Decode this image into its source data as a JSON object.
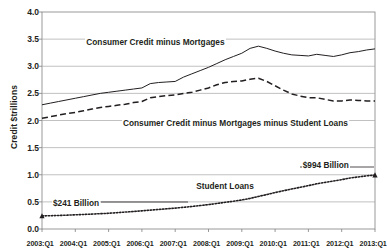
{
  "chart_data": {
    "type": "line",
    "title": "",
    "xlabel": "",
    "ylabel": "Credit $trillions",
    "ylim": [
      0.0,
      4.0
    ],
    "yticks": [
      "0.0",
      "0.5",
      "1.0",
      "1.5",
      "2.0",
      "2.5",
      "3.0",
      "3.5",
      "4.0"
    ],
    "ytick_values": [
      0.0,
      0.5,
      1.0,
      1.5,
      2.0,
      2.5,
      3.0,
      3.5,
      4.0
    ],
    "grid": "horizontal",
    "legend": "inline-annotations",
    "categories": [
      "2003:Q1",
      "2003:Q2",
      "2003:Q3",
      "2003:Q4",
      "2004:Q1",
      "2004:Q2",
      "2004:Q3",
      "2004:Q4",
      "2005:Q1",
      "2005:Q2",
      "2005:Q3",
      "2005:Q4",
      "2006:Q1",
      "2006:Q2",
      "2006:Q3",
      "2006:Q4",
      "2007:Q1",
      "2007:Q2",
      "2007:Q3",
      "2007:Q4",
      "2008:Q1",
      "2008:Q2",
      "2008:Q3",
      "2008:Q4",
      "2009:Q1",
      "2009:Q2",
      "2009:Q3",
      "2009:Q4",
      "2010:Q1",
      "2010:Q2",
      "2010:Q3",
      "2010:Q4",
      "2011:Q1",
      "2011:Q2",
      "2011:Q3",
      "2011:Q4",
      "2012:Q1",
      "2012:Q2",
      "2012:Q3",
      "2012:Q4",
      "2013:Q1"
    ],
    "xticks": [
      "2003:Q1",
      "2004:Q1",
      "2005:Q1",
      "2006:Q1",
      "2007:Q1",
      "2008:Q1",
      "2009:Q1",
      "2010:Q1",
      "2011:Q1",
      "2012:Q1",
      "2013:Q1"
    ],
    "series": [
      {
        "name": "Consumer Credit minus Mortgages",
        "style": "solid",
        "label_text": "Consumer Credit minus Mortgages",
        "values": [
          2.29,
          2.32,
          2.35,
          2.38,
          2.41,
          2.44,
          2.47,
          2.5,
          2.52,
          2.54,
          2.56,
          2.58,
          2.6,
          2.68,
          2.7,
          2.71,
          2.72,
          2.8,
          2.86,
          2.92,
          2.98,
          3.05,
          3.12,
          3.18,
          3.24,
          3.33,
          3.37,
          3.33,
          3.28,
          3.24,
          3.21,
          3.2,
          3.19,
          3.22,
          3.2,
          3.18,
          3.21,
          3.25,
          3.27,
          3.3,
          3.32
        ]
      },
      {
        "name": "Consumer Credit minus Mortgages minus Student Loans",
        "style": "dashed",
        "label_text": "Consumer Credit minus Mortgages minus Student Loans",
        "values": [
          2.04,
          2.07,
          2.1,
          2.13,
          2.15,
          2.18,
          2.21,
          2.24,
          2.26,
          2.28,
          2.3,
          2.33,
          2.35,
          2.42,
          2.44,
          2.46,
          2.47,
          2.5,
          2.52,
          2.56,
          2.6,
          2.66,
          2.7,
          2.72,
          2.73,
          2.76,
          2.78,
          2.72,
          2.64,
          2.56,
          2.49,
          2.45,
          2.42,
          2.42,
          2.39,
          2.36,
          2.36,
          2.38,
          2.37,
          2.36,
          2.36
        ]
      },
      {
        "name": "Student Loans",
        "style": "dotted",
        "label_text": "Student Loans",
        "values": [
          0.241,
          0.245,
          0.25,
          0.255,
          0.262,
          0.268,
          0.275,
          0.282,
          0.29,
          0.3,
          0.312,
          0.323,
          0.335,
          0.348,
          0.36,
          0.372,
          0.385,
          0.4,
          0.415,
          0.432,
          0.45,
          0.47,
          0.492,
          0.512,
          0.535,
          0.565,
          0.6,
          0.635,
          0.672,
          0.705,
          0.738,
          0.768,
          0.8,
          0.833,
          0.86,
          0.885,
          0.91,
          0.94,
          0.96,
          0.98,
          0.994
        ]
      }
    ],
    "annotations": [
      {
        "text": "Consumer Credit minus Mortgages",
        "x_pct": 13,
        "y_value": 3.42
      },
      {
        "text": "Consumer Credit minus Mortgages minus Student Loans",
        "x_pct": 24,
        "y_value": 1.93
      },
      {
        "text": "Student Loans",
        "x_pct": 46,
        "y_value": 0.77
      },
      {
        "text": "$241 Billion",
        "x_pct": 3,
        "y_value": 0.46
      },
      {
        "text": "$994 Billion",
        "x_pct": 78,
        "y_value": 1.17
      }
    ]
  },
  "colors": {
    "line": "#231f20",
    "grid": "#a6a6a6",
    "axis": "#808080",
    "background": "#ffffff"
  }
}
